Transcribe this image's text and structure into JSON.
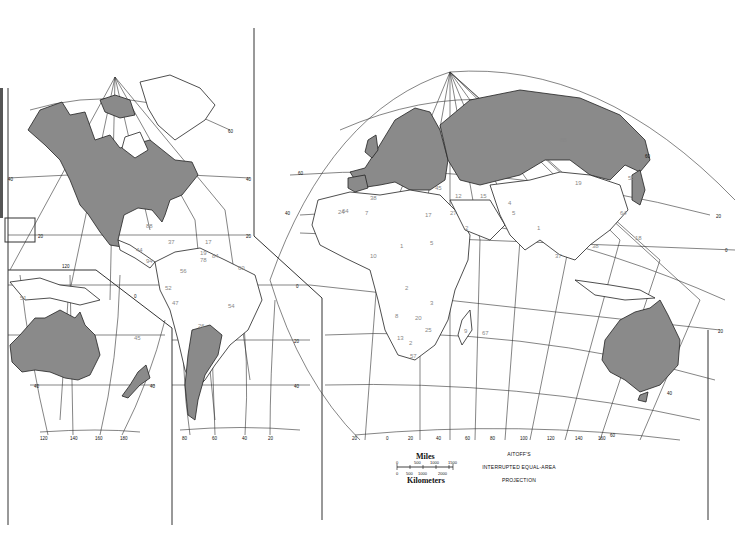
{
  "map": {
    "title": "Aitoff's Interrupted Equal-Area Projection",
    "projection_lines": [
      "AITOFF'S",
      "INTERRUPTED EQUAL-AREA",
      "PROJECTION"
    ],
    "scale": {
      "miles_label": "Miles",
      "km_label": "Kilometers",
      "miles_ticks": [
        "0",
        "500",
        "1000",
        "1500"
      ],
      "km_ticks": [
        "0",
        "500",
        "1000",
        "2000"
      ]
    },
    "highlighted_regions": [
      "North America (Canada, USA, Mexico)",
      "Europe",
      "Russia",
      "Australia",
      "Argentina",
      "Japan",
      "Korea"
    ],
    "fill_color": "#8a8a8a",
    "outline_color": "#222222",
    "graticule_labels": {
      "left_lat": [
        "60",
        "40",
        "20",
        "0",
        "20",
        "40",
        "60"
      ],
      "bottom_lon_left": [
        "120",
        "140",
        "160",
        "180"
      ],
      "bottom_lon_sa": [
        "80",
        "60",
        "40",
        "20"
      ],
      "bottom_lon_right": [
        "20",
        "0",
        "20",
        "40",
        "60",
        "80",
        "100",
        "120",
        "140",
        "160"
      ],
      "right_lat": [
        "60",
        "40",
        "20",
        "0",
        "20",
        "40",
        "60"
      ]
    },
    "country_numbers": {
      "americas": [
        "88",
        "71",
        "8",
        "37",
        "39",
        "51",
        "17",
        "19",
        "84",
        "22",
        "44",
        "94",
        "7",
        "56",
        "78",
        "45",
        "60",
        "52",
        "47",
        "54",
        "26",
        "75"
      ],
      "africa_europe": [
        "64",
        "41",
        "45",
        "38",
        "12",
        "17",
        "24",
        "7",
        "17",
        "27",
        "2",
        "15",
        "3",
        "1",
        "1",
        "1",
        "10",
        "28",
        "4",
        "5",
        "1",
        "2",
        "2",
        "140",
        "8",
        "3",
        "2",
        "3",
        "34",
        "8",
        "20",
        "13",
        "2",
        "25",
        "22",
        "57",
        "9",
        "67"
      ],
      "asia": [
        "88",
        "19",
        "55",
        "4",
        "5",
        "1",
        "100",
        "140",
        "9",
        "64",
        "11",
        "6",
        "38",
        "18",
        "37",
        "11",
        "3",
        "2",
        "45"
      ],
      "oceania": [
        "51",
        "2",
        "3",
        "45"
      ]
    }
  }
}
